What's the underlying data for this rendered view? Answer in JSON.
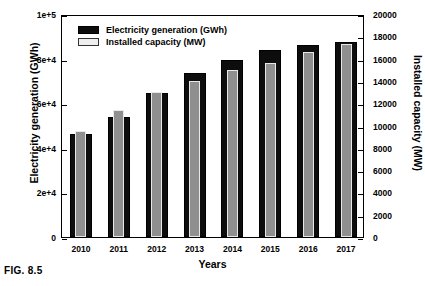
{
  "caption": "FIG. 8.5",
  "chart_data": {
    "type": "bar",
    "title": "",
    "xlabel": "Years",
    "ylabel": "Electricity generation (GWh)",
    "y2label": "Installed capacity (MW)",
    "categories": [
      "2010",
      "2011",
      "2012",
      "2013",
      "2014",
      "2015",
      "2016",
      "2017"
    ],
    "ylim": [
      0,
      100000
    ],
    "y2lim": [
      0,
      20000
    ],
    "yticks": [
      0,
      20000,
      40000,
      60000,
      80000,
      100000
    ],
    "ytick_labels": [
      "0",
      "2e+4",
      "4e+4",
      "6e+4",
      "8e+4",
      "1e+5"
    ],
    "y2ticks": [
      0,
      2000,
      4000,
      6000,
      8000,
      10000,
      12000,
      14000,
      16000,
      18000,
      20000
    ],
    "y2tick_labels": [
      "0",
      "2000",
      "4000",
      "6000",
      "8000",
      "10000",
      "12000",
      "14000",
      "16000",
      "18000",
      "20000"
    ],
    "grid": false,
    "legend_position": "top-left",
    "series": [
      {
        "name": "Electricity generation (GWh)",
        "axis": "left",
        "color": "#0d0d0d",
        "values": [
          46000,
          54000,
          64500,
          73500,
          79500,
          84000,
          86000,
          87500
        ]
      },
      {
        "name": "Installed capacity (MW)",
        "axis": "right",
        "color": "#8f8f8f",
        "values": [
          9500,
          11400,
          13000,
          14000,
          15000,
          15600,
          16600,
          17300
        ]
      }
    ]
  }
}
